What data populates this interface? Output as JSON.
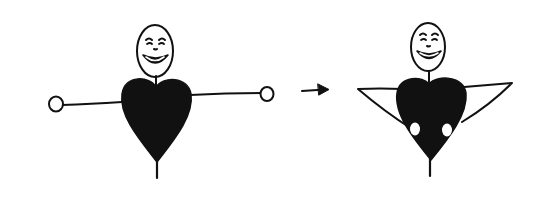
{
  "diagram": {
    "type": "illustration",
    "colors": {
      "ink": "#111111",
      "background": "#ffffff",
      "hand_fill": "#ffffff"
    },
    "figures": [
      {
        "id": "figure-arms-open",
        "pose": "arms outstretched",
        "expression": "smiling"
      },
      {
        "id": "figure-self-hug",
        "pose": "arms wrapped around heart body",
        "expression": "smiling"
      }
    ],
    "connector": {
      "type": "arrow",
      "direction": "right",
      "from": "figure-arms-open",
      "to": "figure-self-hug"
    }
  }
}
